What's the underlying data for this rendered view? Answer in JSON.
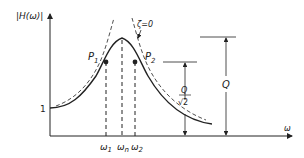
{
  "figure": {
    "type": "resonance frequency response diagram",
    "y_axis_label": "|H(ω)|",
    "x_axis_label": "ω",
    "y_tick_label": "1",
    "zeta_label": "ζ=0",
    "points": [
      {
        "name": "P1",
        "label_main": "P",
        "label_sub": "1"
      },
      {
        "name": "P2",
        "label_main": "P",
        "label_sub": "2"
      }
    ],
    "x_ticks": [
      {
        "main": "ω",
        "sub": "1"
      },
      {
        "main": "ω",
        "sub": "n"
      },
      {
        "main": "ω",
        "sub": "2"
      }
    ],
    "dimension_Q": {
      "label": "Q"
    },
    "dimension_Q_sqrt2": {
      "numerator": "Q",
      "denominator": "√2"
    },
    "colors": {
      "line": "#222222",
      "background": "#ffffff"
    }
  }
}
